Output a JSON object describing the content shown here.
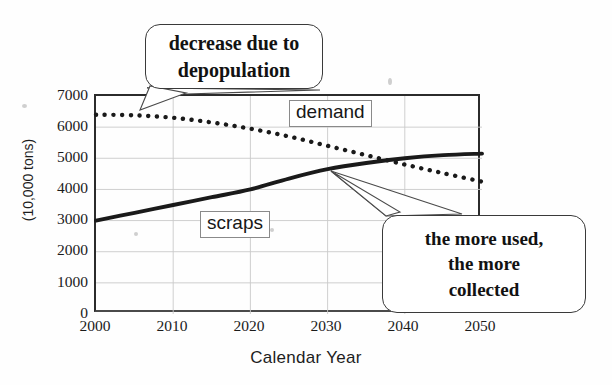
{
  "chart_data": {
    "type": "line",
    "title": "",
    "xlabel": "Calendar Year",
    "ylabel": "(10,000 tons)",
    "x": [
      2000,
      2005,
      2010,
      2015,
      2020,
      2025,
      2030,
      2035,
      2040,
      2045,
      2050
    ],
    "xlim": [
      2000,
      2050
    ],
    "ylim": [
      0,
      7000
    ],
    "xticks": [
      "2000",
      "2010",
      "2020",
      "2030",
      "2040",
      "2050"
    ],
    "yticks": [
      "0",
      "1000",
      "2000",
      "3000",
      "4000",
      "5000",
      "6000",
      "7000"
    ],
    "grid": true,
    "legend_position": "inline-labels",
    "series": [
      {
        "name": "demand",
        "style": "dotted",
        "color": "#1a1a1a",
        "values": [
          6400,
          6380,
          6300,
          6150,
          5950,
          5700,
          5400,
          5100,
          4800,
          4520,
          4250
        ]
      },
      {
        "name": "scraps",
        "style": "solid-thick",
        "color": "#1a1a1a",
        "values": [
          3000,
          3250,
          3500,
          3750,
          4000,
          4350,
          4650,
          4850,
          5000,
          5100,
          5150
        ]
      }
    ],
    "annotations": [
      {
        "id": "depopulation",
        "lines": [
          "decrease due to",
          "depopulation"
        ],
        "points_to_series": "demand",
        "points_to_x": 2012
      },
      {
        "id": "collected",
        "lines": [
          "the more used,",
          "the more",
          "collected"
        ],
        "points_to_series": "crossing",
        "points_to_x": 2030
      }
    ]
  },
  "axis": {
    "y_title": "(10,000 tons)",
    "x_title": "Calendar Year",
    "y_ticks": [
      {
        "label": "7000",
        "value": 7000
      },
      {
        "label": "6000",
        "value": 6000
      },
      {
        "label": "5000",
        "value": 5000
      },
      {
        "label": "4000",
        "value": 4000
      },
      {
        "label": "3000",
        "value": 3000
      },
      {
        "label": "2000",
        "value": 2000
      },
      {
        "label": "1000",
        "value": 1000
      },
      {
        "label": "0",
        "value": 0
      }
    ],
    "x_ticks": [
      {
        "label": "2000",
        "value": 2000
      },
      {
        "label": "2010",
        "value": 2010
      },
      {
        "label": "2020",
        "value": 2020
      },
      {
        "label": "2030",
        "value": 2030
      },
      {
        "label": "2040",
        "value": 2040
      },
      {
        "label": "2050",
        "value": 2050
      }
    ]
  },
  "series_tags": {
    "demand": "demand",
    "scraps": "scraps"
  },
  "callouts": {
    "depopulation": {
      "line1": "decrease due to",
      "line2": "depopulation"
    },
    "collected": {
      "line1": "the more used,",
      "line2": "the more",
      "line3": "collected"
    }
  },
  "colors": {
    "ink": "#1a1a1a",
    "axis": "#2b2b2b",
    "grid": "#c9c9c9",
    "callout_border": "#3a3a3a",
    "background": "#fefefe"
  }
}
